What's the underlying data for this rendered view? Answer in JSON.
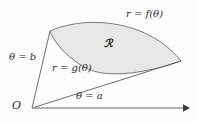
{
  "figure": {
    "type": "polar-region-diagram",
    "background_color": "#fdfdfd",
    "region": {
      "label": "ℛ",
      "fill_color": "#e8e8e8",
      "stroke_color": "#6f6f6f"
    },
    "labels": {
      "outer_curve": "r = f(θ)",
      "inner_curve": "r = g(θ)",
      "ray_upper": "θ = b",
      "ray_lower": "θ = a",
      "origin": "O"
    },
    "axis": {
      "color": "#9a9a9a",
      "arrow_color": "#3a3a3a",
      "start_x": 32,
      "start_y": 108,
      "end_x": 188,
      "end_y": 108
    },
    "geometry": {
      "origin_point": [
        32,
        108
      ],
      "upper_ray_end": [
        50,
        31
      ],
      "lower_ray_end": [
        181,
        61
      ],
      "outer_curve_peak": [
        110,
        22
      ],
      "inner_curve_dip": [
        95,
        62
      ]
    }
  }
}
